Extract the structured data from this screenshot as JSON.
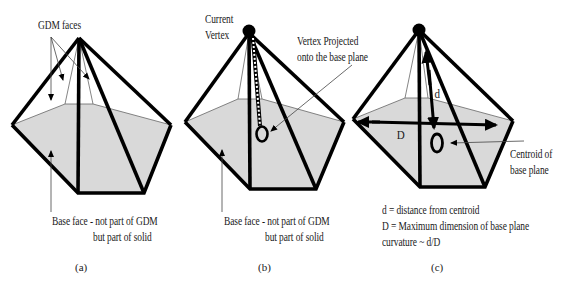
{
  "figure": {
    "panels": [
      {
        "id": "a",
        "caption": "(a)",
        "labels": {
          "top": "GDM faces",
          "base_line1": "Base face - not part of GDM",
          "base_line2": "but part of solid"
        }
      },
      {
        "id": "b",
        "caption": "(b)",
        "labels": {
          "vertex_line1": "Current",
          "vertex_line2": "Vertex",
          "projected_line1": "Vertex Projected",
          "projected_line2": "onto the base plane",
          "base_line1": "Base face - not part of GDM",
          "base_line2": "but part of solid"
        }
      },
      {
        "id": "c",
        "caption": "(c)",
        "labels": {
          "d_symbol": "d",
          "D_symbol": "D",
          "centroid_line1": "Centroid of",
          "centroid_line2": "base plane",
          "legend_d": "d = distance from centroid",
          "legend_D": "D = Maximum dimension of base plane",
          "legend_curvature": "curvature ~ d/D"
        }
      }
    ],
    "colors": {
      "edge": "#000000",
      "base_fill": "#d9d9d9",
      "thin_line": "#555555",
      "background": "#ffffff"
    }
  }
}
